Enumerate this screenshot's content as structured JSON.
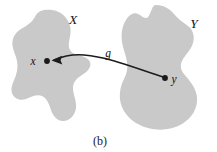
{
  "figure": {
    "caption": "(b)",
    "background_color": "#ffffff",
    "blob_fill_color": "#c9c9c9",
    "ink_color": "#1c1c1c",
    "sets": [
      {
        "id": "X",
        "label": "X",
        "label_x": 73,
        "label_y": 24
      },
      {
        "id": "Y",
        "label": "Y",
        "label_x": 194,
        "label_y": 28
      }
    ],
    "points": [
      {
        "id": "x",
        "label": "x",
        "cx": 47,
        "cy": 61,
        "label_x": 33,
        "label_y": 65
      },
      {
        "id": "y",
        "label": "y",
        "cx": 165,
        "cy": 78,
        "label_x": 174,
        "label_y": 83
      }
    ],
    "mapping": {
      "label": "g",
      "label_x": 108,
      "label_y": 57,
      "direction": "y-to-x",
      "from_point": "y",
      "to_point": "x"
    }
  }
}
